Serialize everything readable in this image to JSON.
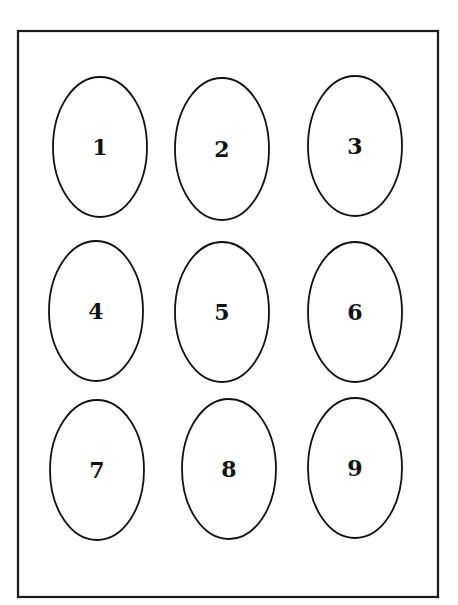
{
  "diagram": {
    "frame": {
      "x": 18,
      "y": 31,
      "width": 420,
      "height": 566,
      "stroke": "#1a1a1a"
    },
    "ellipses": [
      {
        "label": "1",
        "cx": 100,
        "cy": 147,
        "rx": 47,
        "ry": 70
      },
      {
        "label": "2",
        "cx": 222,
        "cy": 149,
        "rx": 47,
        "ry": 71
      },
      {
        "label": "3",
        "cx": 355,
        "cy": 146,
        "rx": 47,
        "ry": 70
      },
      {
        "label": "4",
        "cx": 96,
        "cy": 311,
        "rx": 47,
        "ry": 70
      },
      {
        "label": "5",
        "cx": 222,
        "cy": 312,
        "rx": 47,
        "ry": 70
      },
      {
        "label": "6",
        "cx": 355,
        "cy": 312,
        "rx": 47,
        "ry": 70
      },
      {
        "label": "7",
        "cx": 97,
        "cy": 470,
        "rx": 47,
        "ry": 70
      },
      {
        "label": "8",
        "cx": 229,
        "cy": 469,
        "rx": 47,
        "ry": 70
      },
      {
        "label": "9",
        "cx": 355,
        "cy": 468,
        "rx": 47,
        "ry": 70
      }
    ]
  }
}
